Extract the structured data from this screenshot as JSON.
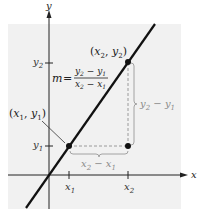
{
  "diagram": {
    "colors": {
      "panel": "#f1f1f1",
      "axis": "#222222",
      "line": "#111111",
      "dashed": "#9a9a9a",
      "annotation": "#8a8a8a"
    },
    "axes": {
      "x_label": "x",
      "y_label": "y",
      "x_ticks": [
        {
          "name": "x1",
          "base": "x",
          "sub": "1"
        },
        {
          "name": "x2",
          "base": "x",
          "sub": "2"
        }
      ],
      "y_ticks": [
        {
          "name": "y1",
          "base": "y",
          "sub": "1"
        },
        {
          "name": "y2",
          "base": "y",
          "sub": "2"
        }
      ]
    },
    "points": [
      {
        "name": "point-1",
        "label_open": "(",
        "label_x": "x",
        "label_x_sub": "1",
        "label_sep": ", ",
        "label_y": "y",
        "label_y_sub": "1",
        "label_close": ")"
      },
      {
        "name": "point-2",
        "label_open": "(",
        "label_x": "x",
        "label_x_sub": "2",
        "label_sep": ", ",
        "label_y": "y",
        "label_y_sub": "2",
        "label_close": ")"
      }
    ],
    "slope_formula": {
      "lhs": "m",
      "equals": "=",
      "numerator": {
        "a": "y",
        "a_sub": "2",
        "op": " − ",
        "b": "y",
        "b_sub": "1"
      },
      "denominator": {
        "a": "x",
        "a_sub": "2",
        "op": " − ",
        "b": "x",
        "b_sub": "1"
      }
    },
    "rise_label": {
      "a": "y",
      "a_sub": "2",
      "op": " − ",
      "b": "y",
      "b_sub": "1"
    },
    "run_label": {
      "a": "x",
      "a_sub": "2",
      "op": " − ",
      "b": "x",
      "b_sub": "1"
    }
  }
}
